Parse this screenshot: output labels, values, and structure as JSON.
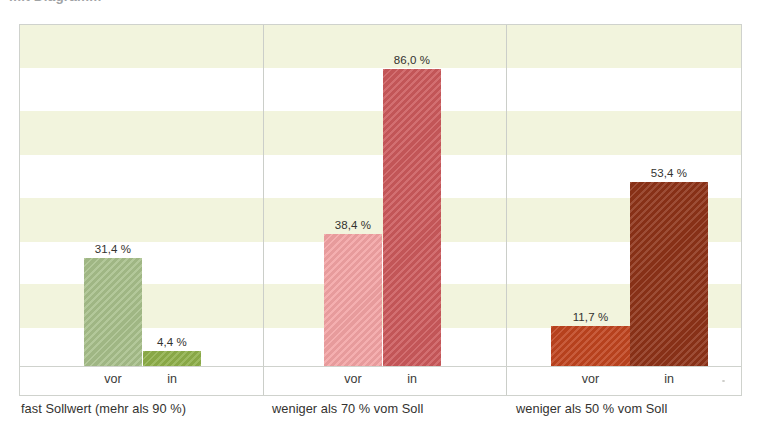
{
  "title_fragment": "mit Diagramm",
  "axis": {
    "tick_labels": [
      "vor",
      "in"
    ]
  },
  "chart_data": {
    "type": "bar",
    "title": "",
    "xlabel": "",
    "ylabel": "",
    "ylim": [
      0,
      99
    ],
    "grid": "horizontal-bands",
    "legend": "none",
    "value_suffix": " %",
    "categories": [
      "vor",
      "in"
    ],
    "groups": [
      {
        "caption": "fast Sollwert (mehr als 90 %)",
        "bars": [
          {
            "category": "vor",
            "label": "31,4 %",
            "value": 31.4,
            "color": "#a8c08b"
          },
          {
            "category": "in",
            "label": "4,4 %",
            "value": 4.4,
            "color": "#8fb04a"
          }
        ]
      },
      {
        "caption": "weniger als 70 % vom Soll",
        "bars": [
          {
            "category": "vor",
            "label": "38,4 %",
            "value": 38.4,
            "color": "#f3a3a4"
          },
          {
            "category": "in",
            "label": "86,0 %",
            "value": 86.0,
            "color": "#cc5a5c"
          }
        ]
      },
      {
        "caption": "weniger als 50 % vom Soll",
        "bars": [
          {
            "category": "vor",
            "label": "11,7 %",
            "value": 11.7,
            "color": "#c0441f"
          },
          {
            "category": "in",
            "label": "53,4 %",
            "value": 53.4,
            "color": "#8e3318"
          }
        ]
      }
    ],
    "band_color": "#f2f4dd",
    "frame_color": "#cfd2cd"
  },
  "layout": {
    "bands": [
      {
        "top": 0,
        "height": 43
      },
      {
        "top": 86,
        "height": 44
      },
      {
        "top": 173,
        "height": 44
      },
      {
        "top": 259,
        "height": 44
      }
    ],
    "panel_separators": [
      243,
      486
    ],
    "panel_width": 241,
    "plot_height": 343,
    "baseline_y": 343,
    "px_per_percent": 3.45,
    "groups_px": [
      {
        "left": 0,
        "caption_left": 21,
        "bars": [
          {
            "left": 64,
            "width": 58
          },
          {
            "left": 123,
            "width": 58
          }
        ]
      },
      {
        "left": 244,
        "caption_left": 272,
        "bars": [
          {
            "left": 60,
            "width": 58
          },
          {
            "left": 119,
            "width": 58
          }
        ]
      },
      {
        "left": 487,
        "caption_left": 516,
        "bars": [
          {
            "left": 44,
            "width": 79
          },
          {
            "left": 123,
            "width": 78
          }
        ]
      }
    ]
  }
}
